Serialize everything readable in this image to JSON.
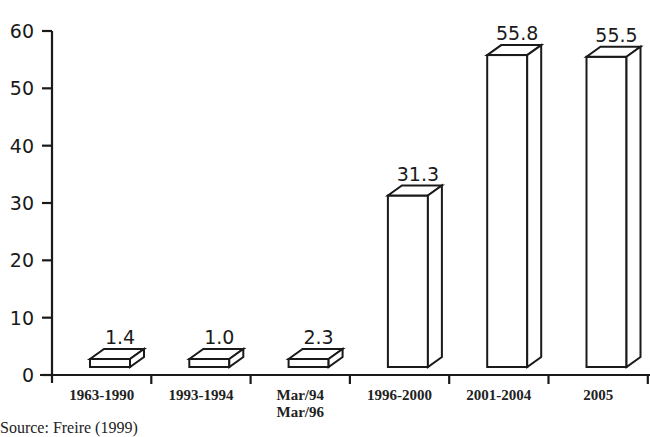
{
  "chart_data": {
    "type": "bar",
    "style": "3d-outline",
    "title": "",
    "xlabel": "",
    "ylabel": "",
    "categories": [
      "1963-1990",
      "1993-1994",
      "Mar/94 Mar/96",
      "1996-2000",
      "2001-2004",
      "2005"
    ],
    "category_lines": [
      [
        "1963-1990"
      ],
      [
        "1993-1994"
      ],
      [
        "Mar/94",
        "Mar/96"
      ],
      [
        "1996-2000"
      ],
      [
        "2001-2004"
      ],
      [
        "2005"
      ]
    ],
    "values": [
      1.4,
      1.0,
      2.3,
      31.3,
      55.8,
      55.5
    ],
    "value_labels": [
      "1.4",
      "1.0",
      "2.3",
      "31.3",
      "55.8",
      "55.5"
    ],
    "ylim": [
      0,
      60
    ],
    "yticks": [
      0,
      10,
      20,
      30,
      40,
      50,
      60
    ],
    "grid": false,
    "legend": null
  },
  "caption": "Source: Freire (1999)"
}
